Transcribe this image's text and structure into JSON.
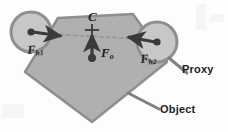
{
  "figure": {
    "background_color": "#fdfdfd",
    "labels": {
      "center_of_mass": "C",
      "force_object": "F",
      "force_object_sub": "o",
      "force_hand1": "F",
      "force_hand1_sub": "h1",
      "force_hand2": "F",
      "force_hand2_sub": "h2",
      "proxy": "Proxy",
      "object": "Object"
    },
    "colors": {
      "object_fill": "#b0b0b0",
      "object_stroke": "#8a8a8a",
      "proxy_fill": "#c9c9c9",
      "proxy_stroke": "#8f8f8f",
      "arrow": "#3a3a3a",
      "dashed_axis": "#9a9a9a",
      "leader_line": "#808080",
      "text": "#1c1c1c"
    },
    "geometry": {
      "object_shape": "pentagon",
      "object_vertices": "58,18 133,14 167,62 92,122 25,72",
      "proxy_left": {
        "cx": 31,
        "cy": 32,
        "r": 20
      },
      "proxy_right": {
        "cx": 157,
        "cy": 42,
        "r": 20
      },
      "center_of_mass_point": {
        "x": 92,
        "y": 33
      },
      "force_object_tail": {
        "x": 92,
        "y": 58
      },
      "force_object_head": {
        "x": 92,
        "y": 34
      },
      "force_hand1_tail": {
        "x": 31,
        "y": 32
      },
      "force_hand1_head": {
        "x": 62,
        "y": 36
      },
      "force_hand2_tail": {
        "x": 157,
        "y": 42
      },
      "force_hand2_head": {
        "x": 127,
        "y": 36
      },
      "dashed_axis_from": {
        "x": 34,
        "y": 33
      },
      "dashed_axis_to": {
        "x": 156,
        "y": 40
      },
      "proxy_leader": "170,58 186,74",
      "object_leader": "130,94 158,110"
    }
  }
}
